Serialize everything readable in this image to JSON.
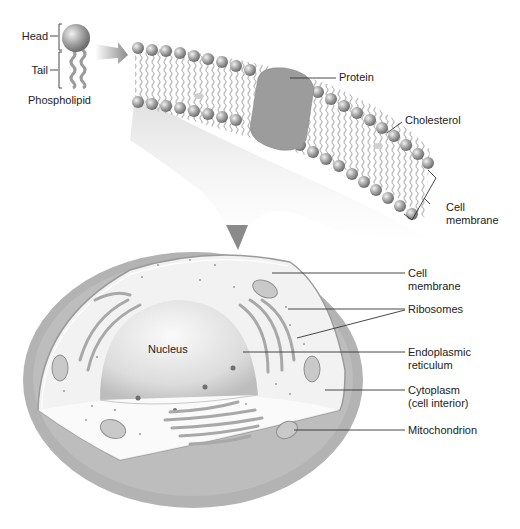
{
  "diagram": {
    "title": "",
    "phospholipid": {
      "label": "Phospholipid",
      "head_label": "Head",
      "tail_label": "Tail"
    },
    "membrane_detail": {
      "labels": {
        "protein": "Protein",
        "cholesterol": "Cholesterol",
        "cell_membrane_line1": "Cell",
        "cell_membrane_line2": "membrane"
      }
    },
    "cell": {
      "labels": {
        "nucleus": "Nucleus",
        "cell_membrane_line1": "Cell",
        "cell_membrane_line2": "membrane",
        "ribosomes": "Ribosomes",
        "er_line1": "Endoplasmic",
        "er_line2": "reticulum",
        "cytoplasm_line1": "Cytoplasm",
        "cytoplasm_line2": "(cell interior)",
        "mitochondrion": "Mitochondrion"
      }
    },
    "colors": {
      "membrane_gray": "#a9a9a9",
      "outer_cell": "#b4b4b4",
      "cytoplasm": "#f1f1f1",
      "nucleus": "#e2e2e2",
      "protein": "#9a9a9a",
      "head_sphere": "#8f8f8f"
    }
  }
}
